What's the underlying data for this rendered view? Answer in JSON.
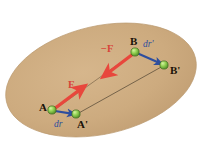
{
  "figure": {
    "background_color": "#ffffff",
    "body_fill": "#cdab7f",
    "body_edge": "#b9986e"
  },
  "labels": {
    "point_a": "A",
    "point_a_prime": "A'",
    "point_b": "B",
    "point_b_prime": "B'",
    "force_f": "F",
    "force_minus_f": "−F",
    "disp_dr": "dr",
    "disp_dr_prime": "dr'"
  },
  "colors": {
    "force_arrow": "#e8473c",
    "force_label": "#d8443a",
    "disp_arrow": "#2e4e9e",
    "disp_label": "#2e4e9e",
    "node_fill": "#8fd14f",
    "node_edge": "#4e7d28",
    "connector_line": "#6b5a43",
    "point_label": "#1a1208"
  },
  "geometry": {
    "ellipse": {
      "cx": 101,
      "cy": 80,
      "rx": 97,
      "ry": 54,
      "rotation_deg": -13
    },
    "nodes": [
      {
        "name": "A",
        "x": 52,
        "y": 110
      },
      {
        "name": "A_prime",
        "x": 76,
        "y": 114
      },
      {
        "name": "B",
        "x": 135,
        "y": 52
      },
      {
        "name": "B_prime",
        "x": 164,
        "y": 65
      }
    ],
    "connectors": [
      {
        "from": "A",
        "to": "B"
      },
      {
        "from": "A_prime",
        "to": "B_prime"
      }
    ],
    "force_arrows": [
      {
        "label": "F",
        "from_x": 54,
        "from_y": 109,
        "to_x": 82,
        "to_y": 88
      },
      {
        "label": "-F",
        "from_x": 133,
        "from_y": 54,
        "to_x": 105,
        "to_y": 75
      }
    ],
    "disp_arrows": [
      {
        "label": "dr",
        "from_x": 54,
        "from_y": 111,
        "to_x": 74,
        "to_y": 114
      },
      {
        "label": "dr'",
        "from_x": 137,
        "from_y": 53,
        "to_x": 162,
        "to_y": 64
      }
    ]
  }
}
